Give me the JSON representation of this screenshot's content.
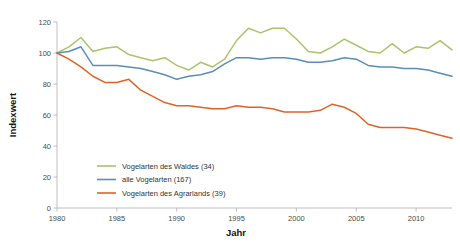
{
  "chart_data": {
    "type": "line",
    "title": "",
    "xlabel": "Jahr",
    "ylabel": "Indexwert",
    "xlim": [
      1980,
      2013
    ],
    "ylim": [
      0,
      120
    ],
    "xticks": [
      1980,
      1985,
      1990,
      1995,
      2000,
      2005,
      2010
    ],
    "yticks": [
      0,
      20,
      40,
      60,
      80,
      100,
      120
    ],
    "grid": false,
    "legend_position": "lower-left-inside",
    "x": [
      1980,
      1981,
      1982,
      1983,
      1984,
      1985,
      1986,
      1987,
      1988,
      1989,
      1990,
      1991,
      1992,
      1993,
      1994,
      1995,
      1996,
      1997,
      1998,
      1999,
      2000,
      2001,
      2002,
      2003,
      2004,
      2005,
      2006,
      2007,
      2008,
      2009,
      2010,
      2011,
      2012,
      2013
    ],
    "series": [
      {
        "name": "Vogelarten des Waldes (34)",
        "count": 34,
        "color": "#a9c46b",
        "values": [
          100,
          104,
          110,
          101,
          103,
          104,
          99,
          97,
          95,
          97,
          92,
          89,
          94,
          91,
          96,
          108,
          116,
          113,
          116,
          116,
          109,
          101,
          100,
          104,
          109,
          105,
          101,
          100,
          106,
          100,
          104,
          103,
          108,
          102
        ]
      },
      {
        "name": "alle Vogelarten (167)",
        "count": 167,
        "color": "#5b8db8",
        "values": [
          100,
          101,
          104,
          92,
          92,
          92,
          91,
          90,
          88,
          86,
          83,
          85,
          86,
          88,
          93,
          97,
          97,
          96,
          97,
          97,
          96,
          94,
          94,
          95,
          97,
          96,
          92,
          91,
          91,
          90,
          90,
          89,
          87,
          85
        ]
      },
      {
        "name": "Vogelarten des Agrarlands (39)",
        "count": 39,
        "color": "#e0622a",
        "values": [
          100,
          96,
          91,
          85,
          81,
          81,
          83,
          76,
          72,
          68,
          66,
          66,
          65,
          64,
          64,
          66,
          65,
          65,
          64,
          62,
          62,
          62,
          63,
          67,
          65,
          61,
          54,
          52,
          52,
          52,
          51,
          49,
          47,
          45
        ]
      }
    ]
  },
  "axes": {
    "x_title": "Jahr",
    "y_title": "Indexwert",
    "x_tick_labels": [
      "1980",
      "1985",
      "1990",
      "1995",
      "2000",
      "2005",
      "2010"
    ],
    "y_tick_labels": [
      "0",
      "20",
      "40",
      "60",
      "80",
      "100",
      "120"
    ]
  },
  "legend": {
    "items": [
      {
        "label": "Vogelarten des Waldes (34)",
        "color": "#a9c46b"
      },
      {
        "label": "alle Vogelarten (167)",
        "color": "#5b8db8"
      },
      {
        "label": "Vogelarten des Agrarlands (39)",
        "color": "#e0622a"
      }
    ]
  }
}
